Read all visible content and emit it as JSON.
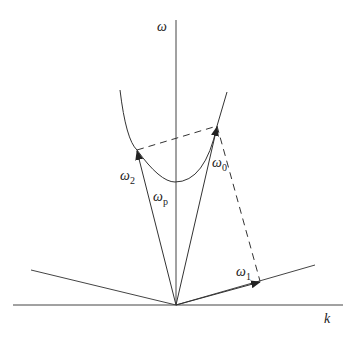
{
  "diagram": {
    "type": "dispersion-diagram",
    "axes": {
      "y_label": "ω",
      "x_label": "k"
    },
    "vectors": [
      {
        "id": "omega0",
        "label": "ω",
        "sub": "0"
      },
      {
        "id": "omega1",
        "label": "ω",
        "sub": "1"
      },
      {
        "id": "omega2",
        "label": "ω",
        "sub": "2"
      }
    ],
    "curve_label": {
      "label": "ω",
      "sub": "p"
    },
    "colors": {
      "line": "#333333",
      "background": "#ffffff"
    }
  }
}
